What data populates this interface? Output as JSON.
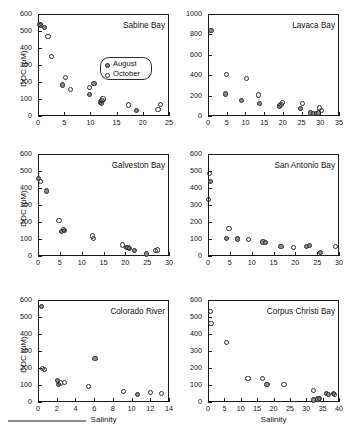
{
  "figure": {
    "axis_label_y": "DOC (μM)",
    "axis_label_x": "Salinity",
    "marker_august_color": "#8a8a8a",
    "marker_october_color": "#ffffff",
    "marker_edge_color": "#2b2b2b"
  },
  "legend": {
    "entries": [
      {
        "label": "August",
        "style": "filled"
      },
      {
        "label": "October",
        "style": "open"
      }
    ]
  },
  "chart_data": [
    {
      "type": "scatter",
      "title": "Sabine Bay",
      "xlabel": "Salinity",
      "ylabel": "DOC (μM)",
      "xlim": [
        0,
        25
      ],
      "ylim": [
        0,
        600
      ],
      "xticks": [
        0,
        5,
        10,
        15,
        20,
        25
      ],
      "yticks": [
        0,
        100,
        200,
        300,
        400,
        500,
        600
      ],
      "grid": false,
      "legend_position": "inside-right-middle",
      "series": [
        {
          "name": "August",
          "points": [
            [
              0.5,
              535
            ],
            [
              1.3,
              520
            ],
            [
              4.6,
              182
            ],
            [
              9.8,
              128
            ],
            [
              10.7,
              192
            ],
            [
              11.9,
              82
            ],
            [
              12.2,
              92
            ],
            [
              18.8,
              32
            ]
          ]
        },
        {
          "name": "October",
          "points": [
            [
              0.3,
              538
            ],
            [
              1.9,
              470
            ],
            [
              2.5,
              352
            ],
            [
              5.3,
              225
            ],
            [
              6.2,
              155
            ],
            [
              9.9,
              168
            ],
            [
              12.4,
              100
            ],
            [
              12.1,
              72
            ],
            [
              17.3,
              65
            ],
            [
              22.9,
              38
            ],
            [
              23.4,
              68
            ]
          ]
        }
      ]
    },
    {
      "type": "scatter",
      "title": "Lavaca Bay",
      "xlabel": "Salinity",
      "ylabel": "DOC (μM)",
      "xlim": [
        0,
        35
      ],
      "ylim": [
        0,
        1000
      ],
      "xticks": [
        0,
        5,
        10,
        15,
        20,
        25,
        30,
        35
      ],
      "yticks": [
        0,
        200,
        400,
        600,
        800,
        1000
      ],
      "grid": false,
      "series": [
        {
          "name": "August",
          "points": [
            [
              0.8,
              838
            ],
            [
              4.6,
              215
            ],
            [
              9.0,
              155
            ],
            [
              13.8,
              125
            ],
            [
              19.0,
              98
            ],
            [
              24.7,
              70
            ],
            [
              27.4,
              30
            ],
            [
              28.2,
              25
            ],
            [
              29.1,
              22
            ],
            [
              29.6,
              30
            ]
          ]
        },
        {
          "name": "October",
          "points": [
            [
              5.0,
              405
            ],
            [
              10.2,
              368
            ],
            [
              13.5,
              205
            ],
            [
              19.5,
              112
            ],
            [
              20.0,
              130
            ],
            [
              25.2,
              125
            ],
            [
              29.8,
              78
            ],
            [
              30.4,
              52
            ]
          ]
        }
      ]
    },
    {
      "type": "scatter",
      "title": "Galveston Bay",
      "xlabel": "Salinity",
      "ylabel": "DOC (μM)",
      "xlim": [
        0,
        30
      ],
      "ylim": [
        0,
        600
      ],
      "xticks": [
        0,
        5,
        10,
        15,
        20,
        25,
        30
      ],
      "yticks": [
        0,
        100,
        200,
        300,
        400,
        500,
        600
      ],
      "grid": false,
      "series": [
        {
          "name": "August",
          "points": [
            [
              0.2,
              458
            ],
            [
              1.9,
              382
            ],
            [
              5.4,
              142
            ],
            [
              6.1,
              152
            ],
            [
              20.3,
              48
            ],
            [
              21.0,
              45
            ],
            [
              22.1,
              32
            ],
            [
              24.8,
              12
            ]
          ]
        },
        {
          "name": "October",
          "points": [
            [
              0.6,
              440
            ],
            [
              4.8,
              208
            ],
            [
              5.9,
              158
            ],
            [
              12.5,
              118
            ],
            [
              12.8,
              102
            ],
            [
              19.4,
              65
            ],
            [
              20.6,
              50
            ],
            [
              27.0,
              32
            ],
            [
              27.4,
              35
            ]
          ]
        }
      ]
    },
    {
      "type": "scatter",
      "title": "San Antonio Bay",
      "xlabel": "Salinity",
      "ylabel": "DOC (μM)",
      "xlim": [
        0,
        30
      ],
      "ylim": [
        0,
        600
      ],
      "xticks": [
        0,
        5,
        10,
        15,
        20,
        25,
        30
      ],
      "yticks": [
        0,
        100,
        200,
        300,
        400,
        500,
        600
      ],
      "grid": false,
      "series": [
        {
          "name": "August",
          "points": [
            [
              0.6,
              440
            ],
            [
              4.3,
              105
            ],
            [
              6.8,
              100
            ],
            [
              12.6,
              82
            ],
            [
              13.2,
              78
            ],
            [
              16.7,
              55
            ],
            [
              22.6,
              58
            ],
            [
              23.2,
              62
            ],
            [
              25.8,
              22
            ]
          ]
        },
        {
          "name": "October",
          "points": [
            [
              0.3,
              485
            ],
            [
              0.2,
              330
            ],
            [
              4.8,
              162
            ],
            [
              9.3,
              98
            ],
            [
              19.5,
              50
            ],
            [
              29.2,
              55
            ]
          ]
        }
      ]
    },
    {
      "type": "scatter",
      "title": "Colorado River",
      "xlabel": "Salinity",
      "ylabel": "DOC (μM)",
      "xlim": [
        0,
        14
      ],
      "ylim": [
        0,
        600
      ],
      "xticks": [
        0,
        2,
        4,
        6,
        8,
        10,
        12,
        14
      ],
      "yticks": [
        0,
        100,
        200,
        300,
        400,
        500,
        600
      ],
      "grid": false,
      "series": [
        {
          "name": "August",
          "points": [
            [
              0.4,
              562
            ],
            [
              2.1,
              128
            ],
            [
              2.2,
              105
            ],
            [
              6.1,
              258
            ],
            [
              10.6,
              45
            ]
          ]
        },
        {
          "name": "October",
          "points": [
            [
              0.5,
              198
            ],
            [
              0.7,
              192
            ],
            [
              2.4,
              112
            ],
            [
              2.8,
              115
            ],
            [
              5.4,
              90
            ],
            [
              9.1,
              60
            ],
            [
              12.0,
              55
            ],
            [
              13.2,
              48
            ]
          ]
        }
      ]
    },
    {
      "type": "scatter",
      "title": "Corpus Christi Bay",
      "xlabel": "Salinity",
      "ylabel": "DOC (μM)",
      "xlim": [
        0,
        40
      ],
      "ylim": [
        0,
        600
      ],
      "xticks": [
        0,
        5,
        10,
        15,
        20,
        25,
        30,
        35,
        40
      ],
      "yticks": [
        0,
        100,
        200,
        300,
        400,
        500,
        600
      ],
      "grid": false,
      "series": [
        {
          "name": "August",
          "points": [
            [
              18.0,
              102
            ],
            [
              32.2,
              12
            ],
            [
              33.6,
              18
            ],
            [
              36.2,
              48
            ],
            [
              36.9,
              45
            ],
            [
              38.2,
              48
            ]
          ]
        },
        {
          "name": "October",
          "points": [
            [
              0.8,
              530
            ],
            [
              0.9,
              462
            ],
            [
              5.7,
              352
            ],
            [
              12.2,
              138
            ],
            [
              16.6,
              140
            ],
            [
              23.2,
              105
            ],
            [
              32.1,
              68
            ],
            [
              34.0,
              22
            ],
            [
              38.6,
              42
            ]
          ]
        }
      ]
    }
  ]
}
